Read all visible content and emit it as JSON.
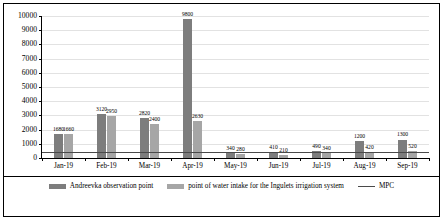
{
  "chart_data": {
    "type": "bar",
    "title": "",
    "xlabel": "",
    "ylabel": "",
    "ylim": [
      0,
      10000
    ],
    "ytick_step": 1000,
    "grid": true,
    "legend_position": "bottom",
    "categories": [
      "Jan-19",
      "Feb-19",
      "Mar-19",
      "Apr-19",
      "May-19",
      "Jun-19",
      "Jul-19",
      "Aug-19",
      "Sep-19"
    ],
    "series": [
      {
        "name": "Andreevka observation point",
        "color": "#7d7d7d",
        "values": [
          1680,
          3120,
          2820,
          9800,
          340,
          410,
          490,
          1200,
          1300
        ]
      },
      {
        "name": "point of water intake for the Ingulets irrigation system",
        "color": "#a6a6a6",
        "values": [
          1660,
          2950,
          2400,
          2630,
          280,
          210,
          340,
          420,
          520
        ]
      }
    ],
    "threshold": {
      "name": "MPC",
      "value": 350,
      "color": "#4a4a4a"
    },
    "ytick_labels": [
      "0",
      "1000",
      "2000",
      "3000",
      "4000",
      "5000",
      "6000",
      "7000",
      "8000",
      "9000",
      "10000"
    ]
  },
  "legend": {
    "items": [
      {
        "label": "Andreevka observation point",
        "marker": "bar-swatch-dark"
      },
      {
        "label": "point of water intake for the Ingulets irrigation system",
        "marker": "bar-swatch-light"
      },
      {
        "label": "MPC",
        "marker": "line-swatch"
      }
    ]
  }
}
